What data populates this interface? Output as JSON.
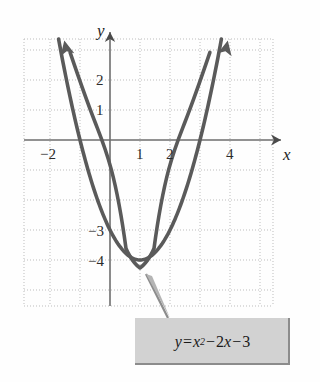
{
  "figure": {
    "background_color": "#fefefe",
    "curve_color": "#5a5a5a",
    "axis_color": "#6e6e6e",
    "grid_color": "#bdbdbd",
    "callout_fill": "#d2d2d2",
    "callout_border": "#8c8c8c"
  },
  "axes": {
    "x_label": "x",
    "y_label": "y",
    "origin_px": {
      "x": 110,
      "y": 140
    },
    "unit_px": 30,
    "x_range": [
      -3.0,
      5.4
    ],
    "y_range": [
      -5.6,
      3.3
    ],
    "grid": "dotted"
  },
  "ticks": {
    "x": [
      {
        "value": -2,
        "label": "−2"
      },
      {
        "value": 1,
        "label": "1"
      },
      {
        "value": 2,
        "label": "2"
      },
      {
        "value": 4,
        "label": "4"
      }
    ],
    "y": [
      {
        "value": 2,
        "label": "2"
      },
      {
        "value": 1,
        "label": "1"
      },
      {
        "value": -3,
        "label": "−3"
      },
      {
        "value": -4,
        "label": "−4"
      }
    ]
  },
  "callout": {
    "equation_plain": "y = x² − 2x − 3",
    "parts": {
      "y": "y",
      "equals": "=",
      "x": "x",
      "exponent": "2",
      "minus1": "−",
      "two": "2",
      "x2": "x",
      "minus2": "−",
      "three": "3"
    }
  },
  "chart_data": {
    "type": "line",
    "title": "",
    "xlabel": "x",
    "ylabel": "y",
    "xlim": [
      -3.0,
      5.4
    ],
    "ylim": [
      -5.6,
      3.3
    ],
    "grid": true,
    "legend": "none",
    "annotations": [
      {
        "text": "y = x² − 2x − 3",
        "type": "callout-box",
        "points_to": [
          1,
          -4
        ]
      }
    ],
    "series": [
      {
        "name": "y = x^2 - 2x - 3",
        "equation": "y = x^2 - 2x - 3",
        "vertex": [
          1,
          -4
        ],
        "roots": [
          -1,
          3
        ],
        "y_intercept": -3,
        "color": "#5a5a5a",
        "arrow_ends": "both",
        "x": [
          -1.45,
          -1.2,
          -1.0,
          -0.75,
          -0.5,
          -0.25,
          0,
          0.25,
          0.5,
          0.75,
          1.0,
          1.25,
          1.5,
          1.75,
          2.0,
          2.25,
          2.5,
          2.75,
          3.0,
          3.2,
          3.45
        ],
        "values": [
          2.0,
          0.84,
          0,
          -1.06,
          -1.75,
          -2.44,
          -3,
          -3.44,
          -3.75,
          -3.94,
          -4,
          -3.94,
          -3.75,
          -3.44,
          -3,
          -2.44,
          -1.75,
          -0.94,
          0,
          0.84,
          2.0
        ]
      }
    ]
  }
}
